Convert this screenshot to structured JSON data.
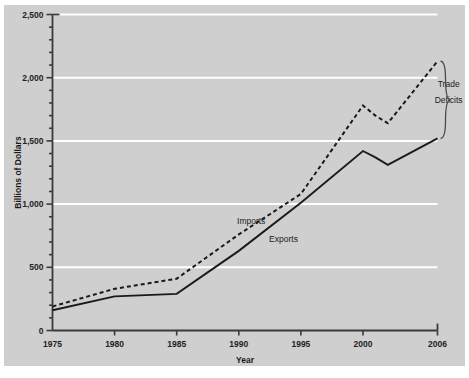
{
  "chart_data": {
    "type": "line",
    "title": "",
    "xlabel": "Year",
    "ylabel": "Billions of Dollars",
    "xlim": [
      1975,
      2006
    ],
    "ylim": [
      0,
      2500
    ],
    "grid": true,
    "grid_axis": "y",
    "legend": "inline-labels",
    "x_tick_labels": [
      "1975",
      "1980",
      "1985",
      "1990",
      "1995",
      "2000",
      "2006"
    ],
    "x_ticks": [
      1975,
      1980,
      1985,
      1990,
      1995,
      2000,
      2006
    ],
    "y_tick_labels": [
      "0",
      "500",
      "1,000",
      "1,500",
      "2,000",
      "2,500"
    ],
    "y_ticks": [
      0,
      500,
      1000,
      1500,
      2000,
      2500
    ],
    "y_minor_step": 100,
    "x": [
      1975,
      1980,
      1985,
      1990,
      1995,
      2000,
      2001,
      2002,
      2006
    ],
    "series": [
      {
        "name": "Imports",
        "style": "dashed",
        "color": "#1a1a1a",
        "values": [
          190,
          330,
          410,
          760,
          1080,
          1780,
          1700,
          1640,
          2130
        ]
      },
      {
        "name": "Exports",
        "style": "solid",
        "color": "#1a1a1a",
        "values": [
          160,
          270,
          290,
          630,
          1010,
          1420,
          1370,
          1310,
          1520
        ]
      }
    ],
    "annotations": [
      {
        "name": "imports-label",
        "text": "Imports",
        "x": 1991.0,
        "y": 840
      },
      {
        "name": "exports-label",
        "text": "Exports",
        "x": 1993.6,
        "y": 700
      },
      {
        "name": "trade-deficits-label",
        "text": "Trade",
        "x": 2006.9,
        "y": 1930
      },
      {
        "name": "trade-deficits-label-2",
        "text": "Deficits",
        "x": 2006.9,
        "y": 1800
      }
    ],
    "brace": {
      "name": "trade-deficits-brace",
      "from_value": 2130,
      "to_value": 1520,
      "label": "Trade Deficits"
    },
    "colors": {
      "plot_background": "#cfcfcf",
      "figure_background": "#ffffff",
      "gridline": "#ffffff",
      "axis": "#3a3a3a",
      "series_line": "#1a1a1a",
      "text": "#1a1a1a"
    }
  }
}
